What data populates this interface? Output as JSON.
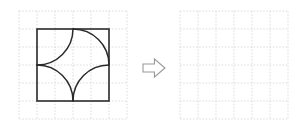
{
  "page": {
    "title": "Geometry puzzle: square with four quarter-circle arcs",
    "background_color": "#ffffff"
  },
  "colors": {
    "grid_line": "#d4d4d4",
    "grid_line_minor": "#e2e2e2",
    "shape_stroke": "#2b2b2b",
    "arrow_stroke": "#9a9a9a",
    "arrow_fill": "#ffffff",
    "panel_background": "#ffffff"
  },
  "left_panel": {
    "name": "question-figure",
    "grid": {
      "columns": 6,
      "rows": 6,
      "cell_size": 18,
      "origin_x": 19,
      "origin_y": 11,
      "style": "dotted"
    },
    "square": {
      "label": "outline-square",
      "x": 37,
      "y": 29,
      "side": 72,
      "stroke_width": 1.6
    },
    "arcs": [
      {
        "label": "arc-top-left",
        "center": [
          37,
          29
        ],
        "radius": 36,
        "from": [
          37,
          65
        ],
        "to": [
          73,
          29
        ],
        "sweep": 0
      },
      {
        "label": "arc-top-right",
        "center": [
          109,
          29
        ],
        "radius": 36,
        "from": [
          73,
          29
        ],
        "to": [
          109,
          65
        ],
        "sweep": 1
      },
      {
        "label": "arc-bottom-left",
        "center": [
          37,
          101
        ],
        "radius": 36,
        "from": [
          37,
          65
        ],
        "to": [
          73,
          101
        ],
        "sweep": 1
      },
      {
        "label": "arc-bottom-right",
        "center": [
          109,
          101
        ],
        "radius": 36,
        "from": [
          73,
          101
        ],
        "to": [
          109,
          65
        ],
        "sweep": 1
      }
    ]
  },
  "arrow": {
    "name": "transform-arrow",
    "direction": "right",
    "x": 143,
    "y": 59,
    "width": 22,
    "height": 18,
    "glyph": "arrow-right-outline"
  },
  "right_panel": {
    "name": "answer-figure",
    "grid": {
      "columns": 6,
      "rows": 6,
      "cell_size": 18,
      "origin_x": 180,
      "origin_y": 11,
      "style": "dotted"
    },
    "content": "empty"
  }
}
